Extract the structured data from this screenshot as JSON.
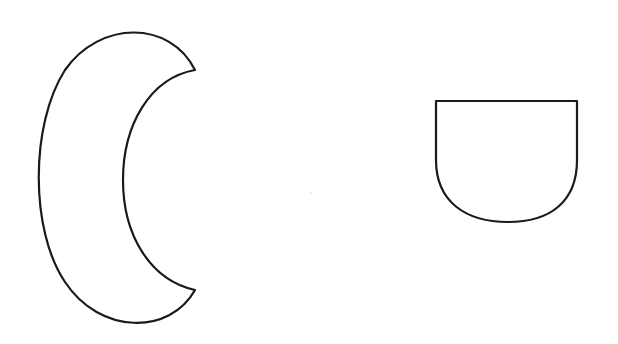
{
  "canvas": {
    "width": 618,
    "height": 344,
    "background": "#ffffff"
  },
  "shapes": [
    {
      "id": "crescent",
      "type": "crescent",
      "stroke": "#1a1a1a",
      "fill": "#ffffff",
      "path": "M195,70 C170,20 100,20 65,70 C30,125 30,230 65,282 C100,335 170,335 195,290 C150,280 123,235 123,180 C123,125 150,78 195,70 Z"
    },
    {
      "id": "cup",
      "type": "rounded-bottom-cup",
      "stroke": "#1a1a1a",
      "fill": "#ffffff",
      "path": "M436,101 L577,101 L577,160 C577,202 550,222 508,222 C466,222 436,202 436,160 Z"
    }
  ]
}
